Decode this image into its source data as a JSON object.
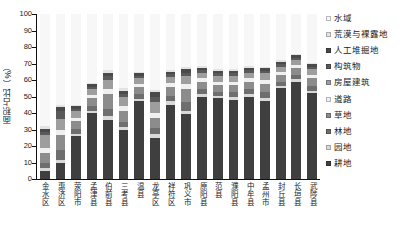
{
  "chart_data": {
    "type": "bar",
    "stacked": true,
    "stack_mode": "percent",
    "title": "",
    "subtitle": "",
    "xlabel": "",
    "ylabel": "面积占比（%）",
    "ylim": [
      0,
      100
    ],
    "ytick_labels": [
      "0",
      "10",
      "20",
      "30",
      "40",
      "50",
      "60",
      "70",
      "80",
      "90",
      "100"
    ],
    "ytick_values": [
      0,
      10,
      20,
      30,
      40,
      50,
      60,
      70,
      80,
      90,
      100
    ],
    "grid": false,
    "legend_position": "right",
    "categories": [
      "金水区",
      "惠济区",
      "荥阳市",
      "孟津县",
      "伯前县",
      "三考县",
      "温县",
      "龙亭区",
      "祥符区",
      "巩义市",
      "原阳县",
      "范县",
      "濮阳县",
      "中牟县",
      "孟州市",
      "封丘县",
      "长垣县",
      "武陟县"
    ],
    "series": [
      {
        "name": "耕地",
        "color": "#3f3f3f",
        "values": [
          5.0,
          9.5,
          26.0,
          40.0,
          36.0,
          29.5,
          47.0,
          25.0,
          45.0,
          39.5,
          50.0,
          49.0,
          48.0,
          50.0,
          47.0,
          55.0,
          59.0,
          52.0
        ]
      },
      {
        "name": "园地",
        "color": "#d9d9d9",
        "values": [
          1.5,
          2.0,
          1.5,
          1.5,
          2.0,
          2.0,
          1.5,
          2.0,
          2.0,
          2.0,
          1.5,
          1.5,
          1.5,
          1.5,
          2.0,
          1.5,
          1.5,
          1.5
        ]
      },
      {
        "name": "林地",
        "color": "#6e6e6e",
        "values": [
          3.0,
          6.0,
          3.0,
          3.0,
          4.5,
          3.0,
          3.0,
          4.0,
          3.5,
          5.0,
          3.0,
          2.5,
          3.0,
          3.0,
          3.5,
          2.5,
          2.5,
          3.0
        ]
      },
      {
        "name": "草地",
        "color": "#8c8c8c",
        "values": [
          6.0,
          9.0,
          4.5,
          4.5,
          9.0,
          7.0,
          4.0,
          6.0,
          5.0,
          8.0,
          4.5,
          4.0,
          4.5,
          4.5,
          5.0,
          4.0,
          4.0,
          4.5
        ]
      },
      {
        "name": "道路",
        "color": "#f0f0f0",
        "values": [
          3.5,
          3.0,
          2.0,
          2.0,
          3.0,
          3.0,
          2.0,
          3.0,
          2.5,
          3.0,
          2.0,
          2.0,
          2.0,
          2.0,
          2.5,
          2.0,
          2.0,
          2.0
        ]
      },
      {
        "name": "房屋建筑",
        "color": "#9e9e9e",
        "values": [
          8.0,
          7.0,
          4.0,
          3.5,
          5.5,
          5.0,
          3.5,
          6.5,
          4.0,
          5.0,
          3.5,
          3.5,
          3.5,
          3.5,
          4.0,
          3.0,
          3.0,
          3.5
        ]
      },
      {
        "name": "构筑物",
        "color": "#5a5a5a",
        "values": [
          1.5,
          4.5,
          1.5,
          1.5,
          2.5,
          2.0,
          1.5,
          3.5,
          1.5,
          2.0,
          1.5,
          1.5,
          1.5,
          1.5,
          1.5,
          1.5,
          1.5,
          1.5
        ]
      },
      {
        "name": "人工堆掘地",
        "color": "#4a4a4a",
        "values": [
          2.0,
          2.5,
          1.5,
          1.5,
          2.0,
          2.0,
          1.5,
          2.5,
          1.5,
          2.0,
          1.5,
          1.5,
          1.5,
          1.5,
          1.5,
          1.5,
          1.5,
          1.5
        ]
      },
      {
        "name": "荒漠与裸露地",
        "color": "#e3e3e3",
        "values": [
          1.5,
          1.5,
          1.0,
          1.0,
          1.5,
          1.5,
          1.0,
          1.5,
          1.0,
          1.5,
          1.0,
          1.0,
          1.0,
          1.0,
          1.0,
          1.0,
          1.0,
          1.0
        ]
      },
      {
        "name": "水域",
        "color": "#f7f7f7",
        "values": [
          68.0,
          55.0,
          55.0,
          41.5,
          34.0,
          45.0,
          35.0,
          46.0,
          34.0,
          32.0,
          31.5,
          33.5,
          33.5,
          31.5,
          32.0,
          28.0,
          24.0,
          29.5
        ]
      }
    ],
    "legend_entries": [
      {
        "label": "水域",
        "color": "#f7f7f7"
      },
      {
        "label": "荒漠与裸露地",
        "color": "#e3e3e3"
      },
      {
        "label": "人工堆掘地",
        "color": "#4a4a4a"
      },
      {
        "label": "构筑物",
        "color": "#5a5a5a"
      },
      {
        "label": "房屋建筑",
        "color": "#9e9e9e"
      },
      {
        "label": "道路",
        "color": "#f0f0f0"
      },
      {
        "label": "草地",
        "color": "#8c8c8c"
      },
      {
        "label": "林地",
        "color": "#6e6e6e"
      },
      {
        "label": "园地",
        "color": "#d9d9d9"
      },
      {
        "label": "耕地",
        "color": "#3f3f3f"
      }
    ]
  }
}
